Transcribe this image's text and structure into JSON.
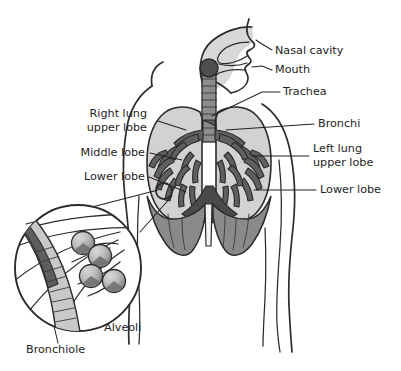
{
  "figure": {
    "type": "anatomical-diagram",
    "background_color": "#ffffff",
    "ink_color": "#2b2b2b",
    "label_color": "#232323"
  },
  "palette": {
    "lung_fill": "#d2d2d2",
    "bronchial_tree": "#606060",
    "trachea_tube": "#8d8d8d",
    "larynx_knob": "#4f4f4f",
    "head_airway_fill": "#d8d8d8",
    "diaphragm": "#8a8a8a",
    "heart_shadow": "#4a4a4a",
    "alveoli_fill": "#bdbdbd",
    "alveoli_shade": "#6e6e6e",
    "bronchiole_dark": "#5e5e5e",
    "bronchiole_light": "#c9c9c9"
  },
  "labels": {
    "right_side": [
      {
        "id": "nasal-cavity",
        "text": "Nasal cavity",
        "x": 275,
        "y": 51
      },
      {
        "id": "mouth",
        "text": "Mouth",
        "x": 275,
        "y": 70
      },
      {
        "id": "trachea",
        "text": "Trachea",
        "x": 283,
        "y": 92
      },
      {
        "id": "bronchi",
        "text": "Bronchi",
        "x": 318,
        "y": 124
      },
      {
        "id": "left-lung-upper-lobe",
        "text": "Left lung",
        "x": 313,
        "y": 149
      },
      {
        "id": "left-lung-upper-lobe-2",
        "text": "upper lobe",
        "x": 313,
        "y": 162
      },
      {
        "id": "lower-lobe-right",
        "text": "Lower lobe",
        "x": 320,
        "y": 190
      }
    ],
    "left_side": [
      {
        "id": "right-lung-upper-lobe",
        "text": "Right lung",
        "x": 113,
        "y": 114
      },
      {
        "id": "right-lung-upper-lobe-2",
        "text": "upper lobe",
        "x": 113,
        "y": 128
      },
      {
        "id": "middle-lobe",
        "text": "Middle lobe",
        "x": 105,
        "y": 153
      },
      {
        "id": "lower-lobe-left",
        "text": "Lower lobe",
        "x": 104,
        "y": 177
      }
    ],
    "inset": [
      {
        "id": "alveoli",
        "text": "Alveoli",
        "x": 104,
        "y": 328
      },
      {
        "id": "bronchiole",
        "text": "Bronchiole",
        "x": 26,
        "y": 350
      }
    ]
  },
  "structures": [
    {
      "id": "torso-outline",
      "name": "Torso and shoulders outline"
    },
    {
      "id": "head-airway",
      "name": "Head, nasal cavity, mouth and pharynx"
    },
    {
      "id": "larynx",
      "name": "Larynx knob"
    },
    {
      "id": "trachea",
      "name": "Trachea with cartilage rings"
    },
    {
      "id": "right-lung",
      "name": "Right lung (viewer left)"
    },
    {
      "id": "left-lung",
      "name": "Left lung (viewer right)"
    },
    {
      "id": "bronchial-tree",
      "name": "Bronchi and bronchial tree"
    },
    {
      "id": "diaphragm",
      "name": "Diaphragm"
    },
    {
      "id": "heart-shadow",
      "name": "Heart / mediastinum shadow"
    },
    {
      "id": "callout-circle",
      "name": "Callout marker on lower lobe"
    },
    {
      "id": "inset-circle",
      "name": "Magnified alveoli inset"
    },
    {
      "id": "alveoli-cluster",
      "name": "Cluster of four alveoli"
    },
    {
      "id": "bronchiole-tube",
      "name": "Bronchiole tube in inset"
    }
  ]
}
